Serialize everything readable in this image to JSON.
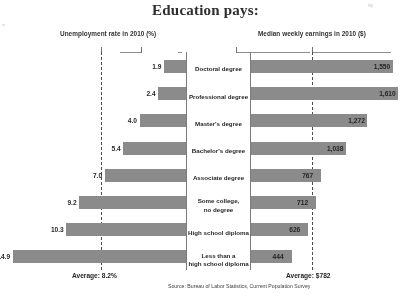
{
  "title": "Education pays:",
  "headers": {
    "left": "Unemployment rate in 2010 (%)",
    "right": "Median weekly earnings in 2010 ($)"
  },
  "averages": {
    "left_label": "Average: 8.2%",
    "right_label": "Average: $782",
    "unemployment_value": 8.2,
    "earnings_value": 782
  },
  "source": "Source: Bureau of Labor Statistics, Current Population Survey",
  "colors": {
    "bar": "#8a8a8a",
    "text": "#1f1f1f",
    "rule": "#7a7a7a"
  },
  "chart_data": {
    "type": "bar",
    "title": "Education pays:",
    "orientation": "horizontal",
    "layout": "back-to-back diverging (tornado)",
    "categories": [
      "Doctoral degree",
      "Professional degree",
      "Master's degree",
      "Bachelor's degree",
      "Associate degree",
      "Some college, no degree",
      "High school diploma",
      "Less than a high school diploma"
    ],
    "category_display": [
      [
        "Doctoral degree"
      ],
      [
        "Professional degree"
      ],
      [
        "Master's degree"
      ],
      [
        "Bachelor's degree"
      ],
      [
        "Associate degree"
      ],
      [
        "Some college,",
        "no degree"
      ],
      [
        "High school diploma"
      ],
      [
        "Less than a",
        "high school diploma"
      ]
    ],
    "series": [
      {
        "name": "Unemployment rate in 2010 (%)",
        "side": "left",
        "unit": "%",
        "values": [
          1.9,
          2.4,
          4.0,
          5.4,
          7.0,
          9.2,
          10.3,
          14.9
        ],
        "labels": [
          "1.9",
          "2.4",
          "4.0",
          "5.4",
          "7.0",
          "9.2",
          "10.3",
          "14.9"
        ],
        "xlim": [
          0,
          16
        ],
        "average": 8.2
      },
      {
        "name": "Median weekly earnings in 2010 ($)",
        "side": "right",
        "unit": "$",
        "values": [
          1550,
          1610,
          1272,
          1038,
          767,
          712,
          626,
          444
        ],
        "labels": [
          "1,550",
          "1,610",
          "1,272",
          "1,038",
          "767",
          "712",
          "626",
          "444"
        ],
        "xlim": [
          0,
          1750
        ],
        "average": 782
      }
    ],
    "annotations": [
      "Average: 8.2%",
      "Average: $782"
    ],
    "grid": false,
    "legend": "none",
    "xlabel": "",
    "ylabel": ""
  }
}
